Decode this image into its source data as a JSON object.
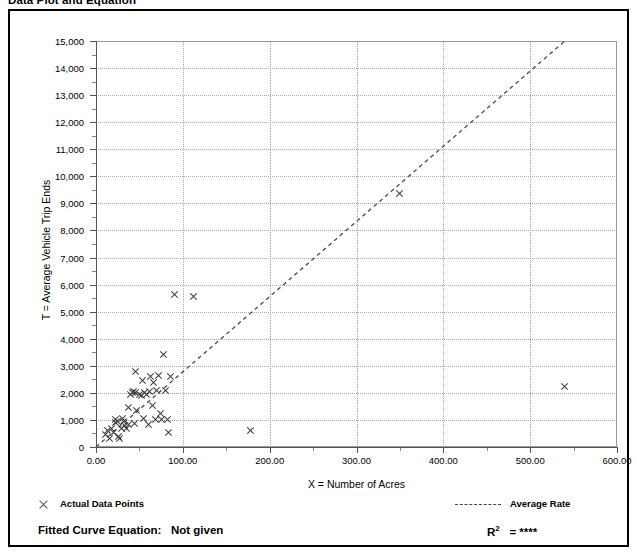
{
  "page_title": "Data Plot and Equation",
  "legend": {
    "points_marker": "x-marker-icon",
    "points_label": "Actual Data Points",
    "rate_marker": "dashed-line-icon",
    "rate_label": "Average Rate",
    "fitted_equation_prefix": "Fitted Curve Equation:",
    "fitted_equation_value": "Not given",
    "r_squared_prefix": "R",
    "r_squared_exponent": "2",
    "r_squared_value": "= ****"
  },
  "colors": {
    "frame": "#000000",
    "grid": "#a8a8a8",
    "axis": "#555555",
    "marker": "#3a3a3a",
    "trend": "#555555",
    "background": "#ffffff"
  },
  "chart_data": {
    "type": "scatter",
    "title": "Data Plot and Equation",
    "xlabel": "X = Number of Acres",
    "ylabel": "T = Average Vehicle Trip Ends",
    "xlim": [
      0,
      600
    ],
    "ylim": [
      0,
      15000
    ],
    "xticks": [
      0,
      100,
      200,
      300,
      400,
      500,
      600
    ],
    "xtick_labels": [
      "0.00",
      "100.00",
      "200.00",
      "300.00",
      "400.00",
      "500.00",
      "600.00"
    ],
    "x_minor_step": 50,
    "yticks": [
      0,
      1000,
      2000,
      3000,
      4000,
      5000,
      6000,
      7000,
      8000,
      9000,
      10000,
      11000,
      12000,
      13000,
      14000,
      15000
    ],
    "ytick_labels": [
      "0",
      "1,000",
      "2,000",
      "3,000",
      "4,000",
      "5,000",
      "6,000",
      "7,000",
      "8,000",
      "9,000",
      "10,000",
      "11,000",
      "12,000",
      "13,000",
      "14,000",
      "15,000"
    ],
    "y_minor_step": 500,
    "grid": true,
    "legend_position": "below-plot",
    "series": [
      {
        "name": "Actual Data Points",
        "marker": "x",
        "points": [
          [
            11,
            450
          ],
          [
            13,
            620
          ],
          [
            15,
            330
          ],
          [
            18,
            700
          ],
          [
            20,
            520
          ],
          [
            22,
            900
          ],
          [
            23,
            1000
          ],
          [
            25,
            960
          ],
          [
            26,
            380
          ],
          [
            27,
            300
          ],
          [
            29,
            700
          ],
          [
            31,
            1050
          ],
          [
            32,
            950
          ],
          [
            33,
            780
          ],
          [
            35,
            700
          ],
          [
            37,
            830
          ],
          [
            38,
            1450
          ],
          [
            40,
            1950
          ],
          [
            42,
            2000
          ],
          [
            43,
            2050
          ],
          [
            44,
            870
          ],
          [
            45,
            2800
          ],
          [
            46,
            2000
          ],
          [
            47,
            1350
          ],
          [
            50,
            1950
          ],
          [
            52,
            1900
          ],
          [
            53,
            2450
          ],
          [
            55,
            1050
          ],
          [
            56,
            2000
          ],
          [
            58,
            1930
          ],
          [
            60,
            830
          ],
          [
            62,
            2050
          ],
          [
            63,
            2600
          ],
          [
            65,
            1550
          ],
          [
            66,
            2400
          ],
          [
            68,
            1020
          ],
          [
            70,
            2100
          ],
          [
            72,
            2650
          ],
          [
            74,
            1250
          ],
          [
            76,
            1000
          ],
          [
            78,
            3400
          ],
          [
            80,
            2100
          ],
          [
            82,
            1000
          ],
          [
            84,
            520
          ],
          [
            86,
            2600
          ],
          [
            90,
            5650
          ],
          [
            112,
            5550
          ],
          [
            178,
            625
          ],
          [
            350,
            9350
          ],
          [
            540,
            2250
          ]
        ]
      }
    ],
    "trend_line": {
      "name": "Average Rate",
      "style": "dashed",
      "x_start": 0,
      "y_start": 0,
      "x_end": 540,
      "y_end": 15000
    }
  }
}
